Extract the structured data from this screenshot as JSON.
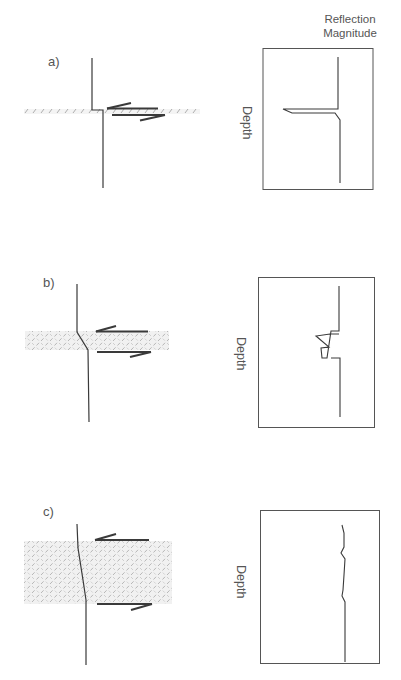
{
  "figure": {
    "column_title_line1": "Reflection",
    "column_title_line2": "Magnitude",
    "panels": [
      {
        "id": "a",
        "label": "a)",
        "layer_thickness": "thin",
        "depth_label": "Depth",
        "reflection_response": "single sharp spike"
      },
      {
        "id": "b",
        "label": "b)",
        "layer_thickness": "medium",
        "depth_label": "Depth",
        "reflection_response": "double zig-zag spike"
      },
      {
        "id": "c",
        "label": "c)",
        "layer_thickness": "thick",
        "depth_label": "Depth",
        "reflection_response": "weak wavy trace"
      }
    ]
  },
  "colors": {
    "line": "#3a3a3a",
    "hatch": "#9a9a9a",
    "hatch_bg": "#efefef",
    "frame": "#555555"
  }
}
